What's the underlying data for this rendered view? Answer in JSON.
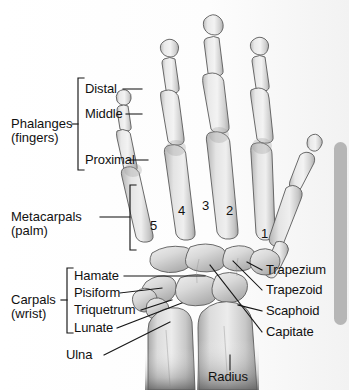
{
  "figure": {
    "background_color": "#ffffff",
    "bone_fill_light": "#ededed",
    "bone_fill_mid": "#d6d6d6",
    "bone_fill_dark": "#b0b0b0",
    "outline_color": "#4a4a4a",
    "leader_color": "#1a1a1a"
  },
  "groups": {
    "phalanges": {
      "line1": "Phalanges",
      "line2": "(fingers)"
    },
    "metacarpals": {
      "line1": "Metacarpals",
      "line2": "(palm)"
    },
    "carpals": {
      "line1": "Carpals",
      "line2": "(wrist)"
    }
  },
  "phalanx_labels": [
    {
      "id": "distal",
      "text": "Distal"
    },
    {
      "id": "middle",
      "text": "Middle"
    },
    {
      "id": "proximal",
      "text": "Proximal"
    }
  ],
  "digit_numbers": [
    {
      "id": "digit-5",
      "text": "5"
    },
    {
      "id": "digit-4",
      "text": "4"
    },
    {
      "id": "digit-3",
      "text": "3"
    },
    {
      "id": "digit-2",
      "text": "2"
    },
    {
      "id": "digit-1",
      "text": "1"
    }
  ],
  "left_labels": [
    {
      "id": "hamate",
      "text": "Hamate"
    },
    {
      "id": "pisiform",
      "text": "Pisiform"
    },
    {
      "id": "triquetrum",
      "text": "Triquetrum"
    },
    {
      "id": "lunate",
      "text": "Lunate"
    },
    {
      "id": "ulna",
      "text": "Ulna"
    }
  ],
  "right_labels": [
    {
      "id": "trapezium",
      "text": "Trapezium"
    },
    {
      "id": "trapezoid",
      "text": "Trapezoid"
    },
    {
      "id": "scaphoid",
      "text": "Scaphoid"
    },
    {
      "id": "capitate",
      "text": "Capitate"
    }
  ],
  "bottom_labels": [
    {
      "id": "radius",
      "text": "Radius"
    }
  ],
  "scrollbar": {
    "color": "#b6b6b6"
  }
}
